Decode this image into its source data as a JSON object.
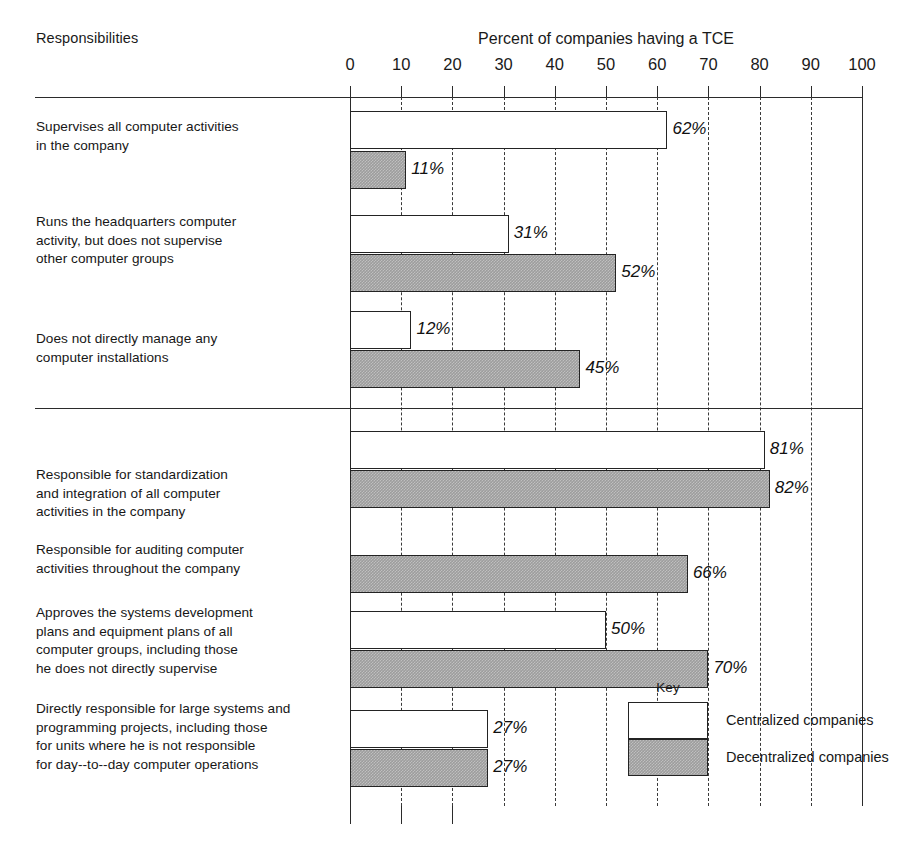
{
  "header": {
    "row_header": "Responsibilities",
    "axis_title": "Percent of companies having a TCE"
  },
  "legend": {
    "title": "Key",
    "entries": [
      {
        "label": "Centralized companies",
        "swatch": "white-bar-swatch"
      },
      {
        "label": "Decentralized companies",
        "swatch": "gray-bar-swatch"
      }
    ]
  },
  "chart_data": {
    "type": "bar",
    "orientation": "horizontal",
    "title": "Percent of companies having a TCE",
    "xlabel": "Percent of companies having a TCE",
    "ylabel": "Responsibilities",
    "xlim": [
      0,
      100
    ],
    "xticks": [
      0,
      10,
      20,
      30,
      40,
      50,
      60,
      70,
      80,
      90,
      100
    ],
    "xtick_labels": [
      "0",
      "10",
      "20",
      "30",
      "40",
      "50",
      "60",
      "70",
      "80",
      "90",
      "100"
    ],
    "grid": "vertical dashed gridlines at every 10 percent",
    "legend_position": "inside lower right",
    "value_suffix": "%",
    "series": [
      {
        "name": "Centralized companies",
        "values": [
          62,
          31,
          12,
          81,
          null,
          50,
          27
        ],
        "labels": [
          "62%",
          "31%",
          "12%",
          "81%",
          "",
          "50%",
          "27%"
        ]
      },
      {
        "name": "Decentralized companies",
        "values": [
          11,
          52,
          45,
          82,
          66,
          70,
          27
        ],
        "labels": [
          "11%",
          "52%",
          "45%",
          "82%",
          "66%",
          "70%",
          "27%"
        ]
      }
    ],
    "categories": [
      "Supervises all computer activities in the company",
      "Runs the headquarters computer activity, but does not supervise other computer groups",
      "Does not directly manage any computer installations",
      "Responsible for standardization and integration of all computer activities in the company",
      "Responsible for auditing computer activities throughout the company",
      "Approves the systems development plans and equipment plans of all computer groups, including those he does not directly supervise",
      "Directly responsible for large systems and programming projects, including those for units where he is not responsible for day--to--day computer operations"
    ],
    "section_break_after_category_index": 2
  },
  "rows": [
    {
      "label": "Supervises all computer activities\nin the company"
    },
    {
      "label": "Runs the headquarters computer\nactivity, but does not supervise\nother computer groups"
    },
    {
      "label": "Does not directly manage any\ncomputer installations"
    },
    {
      "label": "Responsible for standardization\nand integration of all computer\nactivities in the company"
    },
    {
      "label": "Responsible for auditing computer\nactivities throughout the company"
    },
    {
      "label": "Approves the systems development\nplans and equipment plans of all\ncomputer groups, including those\nhe does not directly supervise"
    },
    {
      "label": "Directly responsible for large systems and\nprogramming projects, including those\nfor units where he is not responsible\nfor day--to--day computer operations"
    }
  ],
  "colors": {
    "centralized_fill": "#ffffff",
    "decentralized_fill": "#9d9d9d",
    "line": "#232323",
    "text": "#171717",
    "background": "#ffffff"
  }
}
